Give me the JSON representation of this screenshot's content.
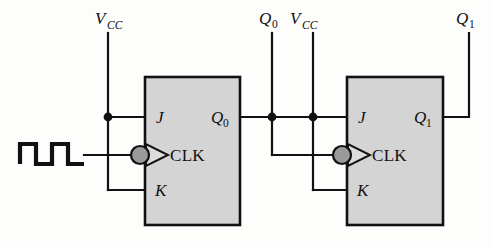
{
  "diagram": {
    "type": "digital-logic-schematic",
    "background_color": "#fdfdfc",
    "wire_color": "#111111",
    "block_fill_color": "#d4d4d4",
    "bubble_fill_color": "#9a9a9a"
  },
  "top_labels": [
    {
      "name": "vcc-left",
      "base": "V",
      "sub": "CC",
      "x": 120,
      "y": 24
    },
    {
      "name": "q0-top",
      "base": "Q",
      "sub": "0",
      "x": 265,
      "y": 24
    },
    {
      "name": "vcc-right",
      "base": "V",
      "sub": "CC",
      "x": 303,
      "y": 24
    },
    {
      "name": "q1-top",
      "base": "Q",
      "sub": "1",
      "x": 462,
      "y": 24
    }
  ],
  "flipflops": [
    {
      "id": "ff0",
      "name": "flip-flop-0",
      "x": 145,
      "y": 77,
      "width": 95,
      "height": 148,
      "pins": {
        "j_label": "J",
        "k_label": "K",
        "clk_label": "CLK",
        "q_base": "Q",
        "q_sub": "0"
      }
    },
    {
      "id": "ff1",
      "name": "flip-flop-1",
      "x": 347,
      "y": 77,
      "width": 96,
      "height": 148,
      "pins": {
        "j_label": "J",
        "k_label": "K",
        "clk_label": "CLK",
        "q_base": "Q",
        "q_sub": "1"
      }
    }
  ],
  "clock_source": {
    "name": "clock-waveform",
    "description": "square-wave clock pulse train",
    "pulse_count": 2
  },
  "junctions": [
    {
      "name": "junction-vcc-left",
      "x": 108,
      "y": 117
    },
    {
      "name": "junction-q0",
      "x": 272,
      "y": 117
    },
    {
      "name": "junction-vcc-right",
      "x": 313,
      "y": 117
    }
  ]
}
